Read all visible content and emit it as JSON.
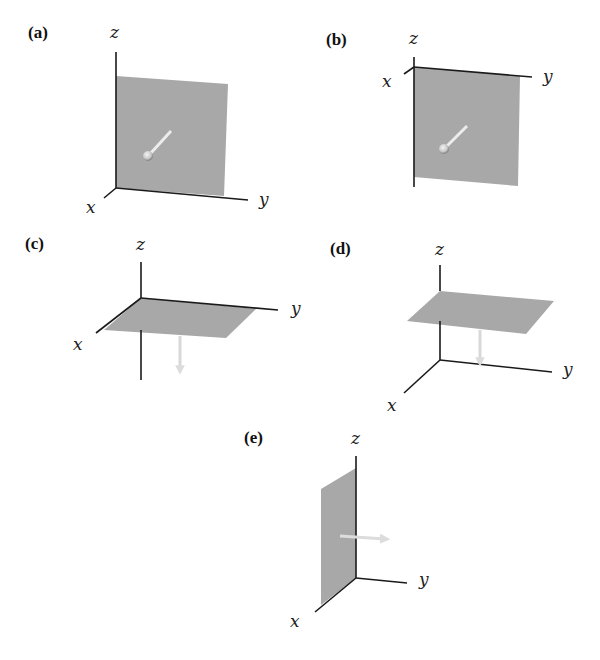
{
  "figure": {
    "panels": [
      {
        "id": "a",
        "label": "(a)",
        "axes": {
          "x": "x",
          "y": "y",
          "z": "z"
        },
        "plane": "xz-plane (vertical, at y=0 side, facing +x)",
        "normal_direction": "+x (toward viewer)"
      },
      {
        "id": "b",
        "label": "(b)",
        "axes": {
          "x": "x",
          "y": "y",
          "z": "z"
        },
        "plane": "vertical plane hanging below y-axis",
        "normal_direction": "+x (toward viewer)"
      },
      {
        "id": "c",
        "label": "(c)",
        "axes": {
          "x": "x",
          "y": "y",
          "z": "z"
        },
        "plane": "xy-plane (horizontal at origin)",
        "normal_direction": "-z (down)"
      },
      {
        "id": "d",
        "label": "(d)",
        "axes": {
          "x": "x",
          "y": "y",
          "z": "z"
        },
        "plane": "horizontal plane above xy-plane",
        "normal_direction": "-z (down)"
      },
      {
        "id": "e",
        "label": "(e)",
        "axes": {
          "x": "x",
          "y": "y",
          "z": "z"
        },
        "plane": "xz-plane (vertical)",
        "normal_direction": "+y"
      }
    ]
  },
  "colors": {
    "plane": "#a8a8a8",
    "axis": "#1a1a1a",
    "arrow": "#e6e6e6"
  }
}
